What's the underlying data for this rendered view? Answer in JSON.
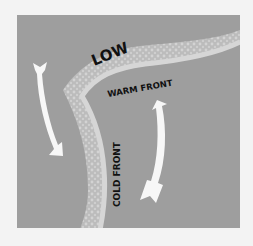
{
  "diagram": {
    "labels": {
      "low": "LOW",
      "warm_front": "WARM FRONT",
      "cold_front": "COLD FRONT"
    },
    "arrows": [
      {
        "name": "cold-air-arrow",
        "direction": "down"
      },
      {
        "name": "warm-air-arrow",
        "direction": "up"
      }
    ],
    "colors": {
      "background": "#f3f3f3",
      "panel": "#9e9e9e",
      "front_band": "#bdbdbd",
      "front_dots": "#d2d2d2",
      "front_edge": "#d8d8d8",
      "arrow": "#f7f7f7",
      "text": "#111111"
    }
  }
}
